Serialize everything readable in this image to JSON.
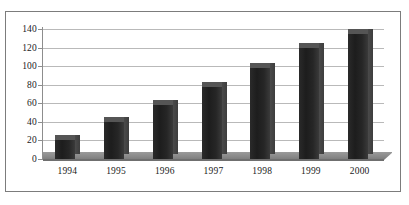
{
  "chart_data": {
    "type": "bar",
    "title": "",
    "subtitle": "",
    "xlabel": "",
    "ylabel": "",
    "categories": [
      "1994",
      "1995",
      "1996",
      "1997",
      "1998",
      "1999",
      "2000"
    ],
    "values": [
      20,
      40,
      58,
      78,
      98,
      120,
      135
    ],
    "series": [
      {
        "name": "",
        "values": [
          20,
          40,
          58,
          78,
          98,
          120,
          135
        ]
      }
    ],
    "ylim": [
      0,
      140
    ],
    "ytick_values": [
      0,
      20,
      40,
      60,
      80,
      100,
      120,
      140
    ],
    "ytick_labels": [
      "0",
      "20",
      "40",
      "60",
      "80",
      "100",
      "120",
      "140"
    ],
    "grid": true,
    "grid_axis": "y",
    "legend": false,
    "legend_position": "none",
    "style": "3d-column",
    "bar_color": "#232323",
    "grid_color": "#b9b9b9",
    "axis_color": "#8d8d8d",
    "floor_color": "#8a8a8a",
    "border_color": "#7c7c7c",
    "background_color": "#ffffff"
  }
}
